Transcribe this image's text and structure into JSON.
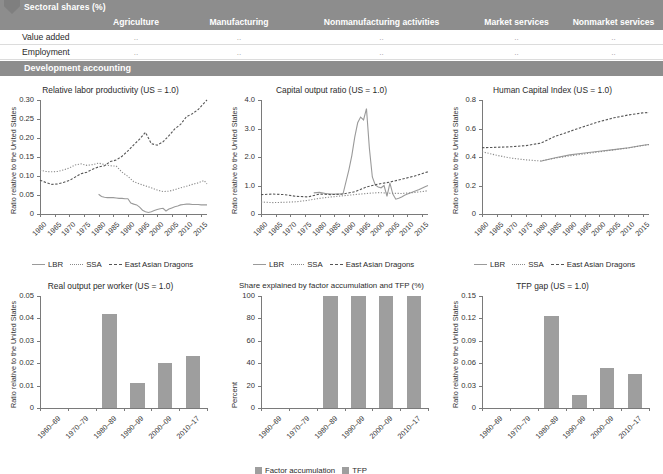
{
  "table": {
    "section_title": "Sectoral shares (%)",
    "columns": [
      "Agriculture",
      "Manufacturing",
      "Nonmanufacturing activities",
      "Market services",
      "Nonmarket services"
    ],
    "rows": [
      {
        "label": "Value added",
        "values": [
          "..",
          "..",
          "..",
          "..",
          ".."
        ]
      },
      {
        "label": "Employment",
        "values": [
          "..",
          "..",
          "..",
          "..",
          ".."
        ]
      }
    ],
    "section_title2": "Development accounting"
  },
  "legend_lines": {
    "lbr": "LBR",
    "ssa": "SSA",
    "ead": "East Asian Dragons"
  },
  "legend_bars": {
    "factor": "Factor accumulation",
    "tfp": "TFP"
  },
  "colors": {
    "band": "#8d8d8d",
    "bar": "#9e9e9e",
    "axis": "#7a7a7a",
    "lbr": "#9a9a9a",
    "ssa": "#8a8a8a",
    "ead": "#555555"
  },
  "chart_data": [
    {
      "id": "relative-labor-productivity",
      "type": "line",
      "title": "Relative labor productivity (US = 1.0)",
      "xlabel": "",
      "ylabel": "Ratio relative to the United States",
      "ylim": [
        0,
        0.3
      ],
      "yticks": [
        "0",
        "0.05",
        "0.10",
        "0.15",
        "0.20",
        "0.25",
        "0.30"
      ],
      "xticks": [
        "1960",
        "1965",
        "1970",
        "1975",
        "1980",
        "1985",
        "1990",
        "1995",
        "2000",
        "2005",
        "2010",
        "2015"
      ],
      "xlim": [
        1960,
        2017
      ],
      "grid": false,
      "legend_position": "bottom",
      "series": [
        {
          "name": "LBR",
          "style": "solid",
          "x": [
            1980,
            1981,
            1982,
            1983,
            1984,
            1985,
            1986,
            1987,
            1988,
            1989,
            1990,
            1991,
            1992,
            1993,
            1994,
            1995,
            1996,
            1997,
            1998,
            1999,
            2000,
            2001,
            2002,
            2003,
            2004,
            2005,
            2006,
            2007,
            2008,
            2009,
            2010,
            2011,
            2012,
            2013,
            2014,
            2015,
            2016,
            2017
          ],
          "values": [
            0.052,
            0.046,
            0.044,
            0.043,
            0.043,
            0.043,
            0.042,
            0.041,
            0.041,
            0.04,
            0.04,
            0.029,
            0.026,
            0.024,
            0.018,
            0.01,
            0.006,
            0.004,
            0.006,
            0.009,
            0.012,
            0.014,
            0.015,
            0.008,
            0.013,
            0.016,
            0.019,
            0.021,
            0.024,
            0.025,
            0.026,
            0.026,
            0.025,
            0.025,
            0.025,
            0.024,
            0.024,
            0.024
          ]
        },
        {
          "name": "SSA",
          "style": "dotted",
          "x": [
            1960,
            1962,
            1964,
            1966,
            1968,
            1970,
            1972,
            1974,
            1976,
            1978,
            1980,
            1982,
            1984,
            1986,
            1988,
            1990,
            1992,
            1994,
            1996,
            1998,
            2000,
            2002,
            2004,
            2006,
            2008,
            2010,
            2012,
            2014,
            2016,
            2017
          ],
          "values": [
            0.115,
            0.112,
            0.111,
            0.112,
            0.116,
            0.121,
            0.129,
            0.132,
            0.128,
            0.13,
            0.134,
            0.13,
            0.127,
            0.126,
            0.11,
            0.099,
            0.085,
            0.079,
            0.074,
            0.069,
            0.063,
            0.059,
            0.06,
            0.064,
            0.069,
            0.073,
            0.078,
            0.082,
            0.088,
            0.079
          ]
        },
        {
          "name": "East Asian Dragons",
          "style": "dashed",
          "x": [
            1960,
            1962,
            1964,
            1966,
            1968,
            1970,
            1972,
            1974,
            1976,
            1978,
            1980,
            1982,
            1984,
            1986,
            1988,
            1990,
            1992,
            1994,
            1996,
            1998,
            2000,
            2002,
            2004,
            2006,
            2008,
            2010,
            2012,
            2014,
            2016,
            2017
          ],
          "values": [
            0.089,
            0.083,
            0.078,
            0.079,
            0.083,
            0.088,
            0.097,
            0.106,
            0.11,
            0.118,
            0.124,
            0.127,
            0.138,
            0.142,
            0.152,
            0.166,
            0.182,
            0.197,
            0.215,
            0.185,
            0.181,
            0.19,
            0.206,
            0.224,
            0.236,
            0.256,
            0.264,
            0.275,
            0.292,
            0.3
          ]
        }
      ]
    },
    {
      "id": "capital-output-ratio",
      "type": "line",
      "title": "Capital output ratio (US = 1.0)",
      "xlabel": "",
      "ylabel": "Ratio relative to the United States",
      "ylim": [
        0,
        4.0
      ],
      "yticks": [
        "0",
        "1.0",
        "2.0",
        "3.0",
        "4.0"
      ],
      "xticks": [
        "1960",
        "1965",
        "1970",
        "1975",
        "1980",
        "1985",
        "1990",
        "1995",
        "2000",
        "2005",
        "2010",
        "2015"
      ],
      "xlim": [
        1960,
        2017
      ],
      "grid": false,
      "legend_position": "bottom",
      "series": [
        {
          "name": "LBR",
          "style": "solid",
          "x": [
            1978,
            1980,
            1982,
            1984,
            1986,
            1988,
            1990,
            1991,
            1992,
            1993,
            1994,
            1995,
            1996,
            1997,
            1998,
            1999,
            2000,
            2001,
            2002,
            2003,
            2004,
            2005,
            2006,
            2007,
            2008,
            2009,
            2010,
            2012,
            2014,
            2016,
            2017
          ],
          "values": [
            0.74,
            0.76,
            0.72,
            0.7,
            0.7,
            0.71,
            1.55,
            2.05,
            2.7,
            3.2,
            3.4,
            3.3,
            3.7,
            2.3,
            1.3,
            1.02,
            0.95,
            0.92,
            1.0,
            0.62,
            1.08,
            0.7,
            0.52,
            0.55,
            0.6,
            0.66,
            0.7,
            0.78,
            0.86,
            0.96,
            1.0
          ]
        },
        {
          "name": "SSA",
          "style": "dotted",
          "x": [
            1960,
            1964,
            1968,
            1972,
            1976,
            1980,
            1984,
            1988,
            1992,
            1996,
            2000,
            2004,
            2008,
            2012,
            2016,
            2017
          ],
          "values": [
            0.42,
            0.4,
            0.41,
            0.43,
            0.48,
            0.55,
            0.6,
            0.64,
            0.68,
            0.72,
            0.75,
            0.73,
            0.72,
            0.75,
            0.8,
            0.82
          ]
        },
        {
          "name": "East Asian Dragons",
          "style": "dashed",
          "x": [
            1960,
            1964,
            1968,
            1972,
            1976,
            1980,
            1984,
            1988,
            1992,
            1996,
            2000,
            2004,
            2008,
            2012,
            2016,
            2017
          ],
          "values": [
            0.68,
            0.7,
            0.68,
            0.62,
            0.6,
            0.7,
            0.68,
            0.7,
            0.78,
            0.95,
            1.05,
            1.12,
            1.22,
            1.32,
            1.45,
            1.48
          ]
        }
      ]
    },
    {
      "id": "human-capital-index",
      "type": "line",
      "title": "Human Capital Index (US = 1.0)",
      "xlabel": "",
      "ylabel": "Ratio relative to the United States",
      "ylim": [
        0,
        0.8
      ],
      "yticks": [
        "0",
        "0.2",
        "0.4",
        "0.6",
        "0.8"
      ],
      "xticks": [
        "1960",
        "1965",
        "1970",
        "1975",
        "1980",
        "1985",
        "1990",
        "1995",
        "2000",
        "2005",
        "2010",
        "2015"
      ],
      "xlim": [
        1960,
        2017
      ],
      "grid": false,
      "legend_position": "bottom",
      "series": [
        {
          "name": "LBR",
          "style": "solid",
          "x": [
            1980,
            1985,
            1990,
            1995,
            2000,
            2005,
            2010,
            2015,
            2017
          ],
          "values": [
            0.37,
            0.395,
            0.415,
            0.428,
            0.44,
            0.452,
            0.465,
            0.483,
            0.488
          ]
        },
        {
          "name": "SSA",
          "style": "dotted",
          "x": [
            1960,
            1965,
            1970,
            1975,
            1980,
            1985,
            1990,
            1995,
            2000,
            2005,
            2010,
            2015,
            2017
          ],
          "values": [
            0.437,
            0.412,
            0.392,
            0.38,
            0.372,
            0.392,
            0.408,
            0.422,
            0.436,
            0.45,
            0.463,
            0.481,
            0.487
          ]
        },
        {
          "name": "East Asian Dragons",
          "style": "dashed",
          "x": [
            1960,
            1965,
            1970,
            1975,
            1980,
            1985,
            1990,
            1995,
            2000,
            2005,
            2010,
            2015,
            2017
          ],
          "values": [
            0.465,
            0.468,
            0.472,
            0.48,
            0.497,
            0.545,
            0.58,
            0.615,
            0.648,
            0.675,
            0.695,
            0.71,
            0.712
          ]
        }
      ]
    },
    {
      "id": "real-output-per-worker",
      "type": "bar",
      "title": "Real output per worker (US = 1.0)",
      "xlabel": "",
      "ylabel": "Ratio relative to the United States",
      "ylim": [
        0,
        0.05
      ],
      "yticks": [
        "0",
        "0.01",
        "0.02",
        "0.03",
        "0.04",
        "0.05"
      ],
      "categories": [
        "1960–69",
        "1970–79",
        "1980–89",
        "1990–99",
        "2000–09",
        "2010–17"
      ],
      "values": [
        0,
        0,
        0.0418,
        0.0111,
        0.0201,
        0.0231
      ],
      "grid": false
    },
    {
      "id": "share-factor-accumulation-tfp",
      "type": "bar",
      "title": "Share explained by factor accumulation and TFP (%)",
      "xlabel": "",
      "ylabel": "Percent",
      "ylim": [
        0,
        100
      ],
      "yticks": [
        "0",
        "20",
        "40",
        "60",
        "80",
        "100"
      ],
      "categories": [
        "1960–69",
        "1970–79",
        "1980–89",
        "1990–99",
        "2000–09",
        "2010–17"
      ],
      "series": [
        {
          "name": "Factor accumulation",
          "values": [
            0,
            0,
            100,
            100,
            100,
            100
          ]
        },
        {
          "name": "TFP",
          "values": [
            0,
            0,
            0,
            0,
            0,
            0
          ]
        }
      ],
      "legend_position": "bottom",
      "grid": false
    },
    {
      "id": "tfp-gap",
      "type": "bar",
      "title": "TFP gap (US = 1.0)",
      "xlabel": "",
      "ylabel": "Ratio relative to the United States",
      "ylim": [
        0,
        0.15
      ],
      "yticks": [
        "0",
        "0.03",
        "0.06",
        "0.09",
        "0.12",
        "0.15"
      ],
      "categories": [
        "1960–69",
        "1970–79",
        "1980–89",
        "1990–99",
        "2000–09",
        "2010–17"
      ],
      "values": [
        0,
        0,
        0.1235,
        0.0173,
        0.0535,
        0.0455
      ],
      "grid": false
    }
  ]
}
